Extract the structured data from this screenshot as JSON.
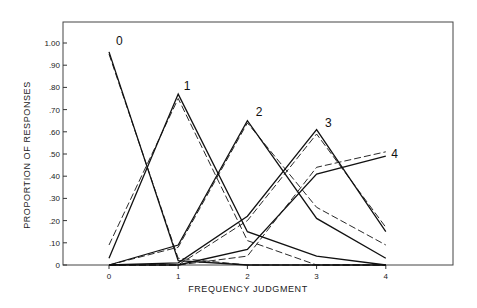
{
  "chart_data": {
    "type": "line",
    "title": "",
    "xlabel": "FREQUENCY JUDGMENT",
    "ylabel": "PROPORTION OF RESPONSES",
    "x": [
      0,
      1,
      2,
      3,
      4
    ],
    "x_tick_labels": [
      "0",
      "1",
      "2",
      "3",
      "4"
    ],
    "y_tick_labels": [
      "0",
      ".10",
      ".20",
      ".30",
      ".40",
      ".50",
      ".60",
      ".70",
      ".80",
      ".90",
      "1.00"
    ],
    "ylim": [
      0,
      1.0
    ],
    "grid": false,
    "legend": "none (curves labeled inline 0-4)",
    "series": [
      {
        "name": "0",
        "style": "solid",
        "values": [
          0.96,
          0.02,
          0.0,
          0.0,
          0.0
        ]
      },
      {
        "name": "0",
        "style": "dashed",
        "values": [
          0.95,
          0.03,
          0.0,
          0.0,
          0.0
        ]
      },
      {
        "name": "1",
        "style": "solid",
        "values": [
          0.03,
          0.77,
          0.15,
          0.04,
          0.0
        ]
      },
      {
        "name": "1",
        "style": "dashed",
        "values": [
          0.09,
          0.75,
          0.11,
          0.0,
          0.0
        ]
      },
      {
        "name": "2",
        "style": "solid",
        "values": [
          0.0,
          0.09,
          0.65,
          0.21,
          0.03
        ]
      },
      {
        "name": "2",
        "style": "dashed",
        "values": [
          0.0,
          0.08,
          0.64,
          0.26,
          0.09
        ]
      },
      {
        "name": "3",
        "style": "solid",
        "values": [
          0.0,
          0.01,
          0.22,
          0.61,
          0.15
        ]
      },
      {
        "name": "3",
        "style": "dashed",
        "values": [
          0.0,
          0.0,
          0.2,
          0.59,
          0.17
        ]
      },
      {
        "name": "4",
        "style": "solid",
        "values": [
          0.0,
          0.0,
          0.07,
          0.41,
          0.49
        ]
      },
      {
        "name": "4",
        "style": "dashed",
        "values": [
          0.0,
          0.0,
          0.04,
          0.44,
          0.51
        ]
      }
    ],
    "curve_labels": [
      {
        "text": "0",
        "x": 0.1,
        "y": 0.99
      },
      {
        "text": "1",
        "x": 1.08,
        "y": 0.79
      },
      {
        "text": "2",
        "x": 2.12,
        "y": 0.67
      },
      {
        "text": "3",
        "x": 3.12,
        "y": 0.62
      },
      {
        "text": "4",
        "x": 4.08,
        "y": 0.48
      }
    ]
  },
  "colors": {
    "line": "#111111",
    "frame": "#333333",
    "background": "#ffffff"
  }
}
